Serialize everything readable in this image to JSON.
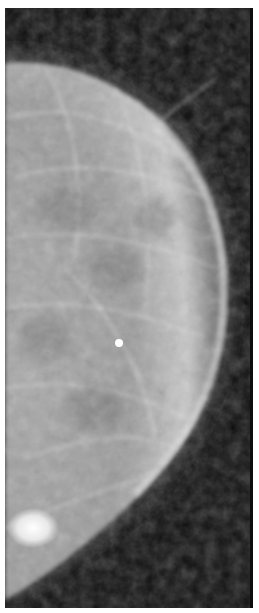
{
  "image": {
    "kind": "mammogram",
    "background_color": "#0d0d0d",
    "border_color": "#ffffff",
    "tissue_color": "#b8b8b8",
    "marker": {
      "x": 119,
      "y": 343,
      "radius": 4,
      "color": "#ffffff"
    },
    "bright_region": {
      "x": 28,
      "y": 528
    }
  }
}
